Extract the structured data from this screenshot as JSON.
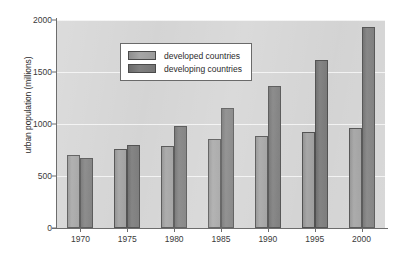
{
  "chart_data": {
    "type": "bar",
    "title": "",
    "xlabel": "",
    "ylabel": "urban population (millions)",
    "categories": [
      "1970",
      "1975",
      "1980",
      "1985",
      "1990",
      "1995",
      "2000"
    ],
    "series": [
      {
        "name": "developed countries",
        "color": "#9b9b9b",
        "values": [
          700,
          760,
          790,
          855,
          885,
          920,
          960
        ]
      },
      {
        "name": "developing countries",
        "color": "#757575",
        "values": [
          670,
          800,
          980,
          1150,
          1365,
          1620,
          1930
        ]
      }
    ],
    "ylim": [
      0,
      2000
    ],
    "yticks": [
      0,
      500,
      1000,
      1500,
      2000
    ],
    "ytick_labels": [
      "0",
      "500",
      "1000",
      "1500",
      "2000"
    ],
    "grid": true,
    "legend_position": "top-left",
    "plot_background": "#d2d2d2"
  }
}
